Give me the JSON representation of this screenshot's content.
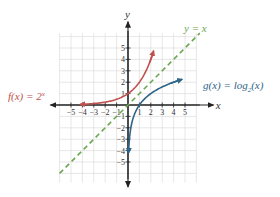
{
  "chart_data": {
    "type": "line",
    "title": "",
    "xlabel": "x",
    "ylabel": "y",
    "xlim": [
      -6,
      6
    ],
    "ylim": [
      -6,
      6
    ],
    "grid": true,
    "x_ticks": [
      -5,
      -4,
      -3,
      -2,
      -1,
      1,
      2,
      3,
      4,
      5
    ],
    "y_ticks": [
      -5,
      -4,
      -3,
      -2,
      -1,
      1,
      2,
      3,
      4,
      5
    ],
    "x_tick_labels": [
      "−5",
      "−4",
      "−3",
      "−2",
      "−1",
      "1",
      "2",
      "3",
      "4",
      "5"
    ],
    "y_tick_labels": [
      "−5",
      "−4",
      "−3",
      "−2",
      "−1",
      "1",
      "2",
      "3",
      "4",
      "5"
    ],
    "series": [
      {
        "name": "f(x) = 2^x",
        "label_text": "f(x) = 2",
        "label_sup": "x",
        "color": "#c0504d",
        "style": "solid",
        "function": "2^x",
        "x": [
          -4.2,
          -3,
          -2,
          -1,
          0,
          1,
          1.5,
          2.2
        ],
        "y": [
          0.05,
          0.125,
          0.25,
          0.5,
          1,
          2,
          2.83,
          4.6
        ]
      },
      {
        "name": "g(x) = log2(x)",
        "label_text": "g(x) = log",
        "label_sub": "2",
        "label_tail": "(x)",
        "color": "#2e6589",
        "style": "solid",
        "function": "log2(x)",
        "x": [
          0.05,
          0.125,
          0.25,
          0.5,
          1,
          2,
          2.83,
          4.6
        ],
        "y": [
          -4.2,
          -3,
          -2,
          -1,
          0,
          1,
          1.5,
          2.2
        ]
      },
      {
        "name": "y = x",
        "label_text": "y = x",
        "color": "#6aa84f",
        "style": "dashed",
        "function": "x",
        "x": [
          -6,
          6.3
        ],
        "y": [
          -6,
          6.3
        ]
      }
    ]
  },
  "labels": {
    "f": {
      "text": "f(x) = 2",
      "sup": "x"
    },
    "g": {
      "text": "g(x) = log",
      "sub": "2",
      "tail": "(x)"
    },
    "identity": {
      "text": "y = x"
    },
    "x_axis": "x",
    "y_axis": "y"
  }
}
